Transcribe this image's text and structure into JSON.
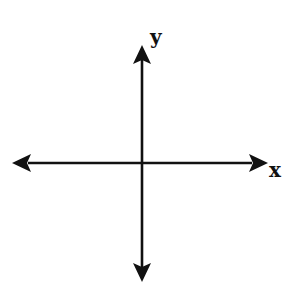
{
  "diagram": {
    "type": "cartesian-axes",
    "labels": {
      "x_axis": "x",
      "y_axis": "y"
    },
    "colors": {
      "stroke": "#111111",
      "background": "#ffffff"
    },
    "axes": {
      "horizontal": {
        "from": [
          12,
          163
        ],
        "to": [
          268,
          163
        ],
        "arrows": "both"
      },
      "vertical": {
        "from": [
          142,
          45
        ],
        "to": [
          142,
          282
        ],
        "arrows": "both"
      }
    }
  }
}
